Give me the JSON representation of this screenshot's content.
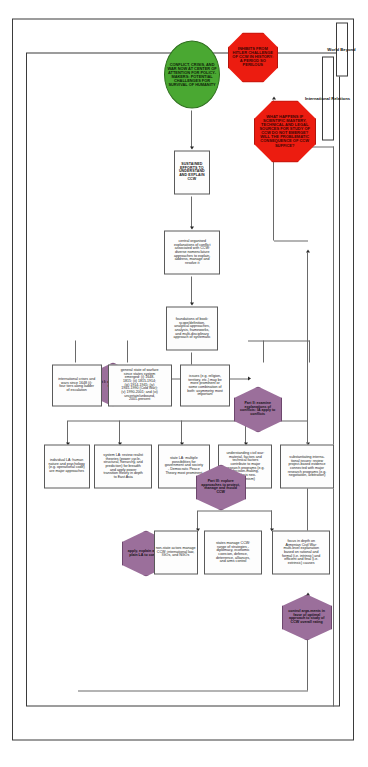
{
  "diagram": {
    "outer_labels": {
      "world_beyond": "World Beyond",
      "international_relations": "International Relations"
    },
    "colors": {
      "octagon_red": "#ec1c10",
      "hexagon_purple": "#9b6f9b",
      "ellipse_green": "#4aa832",
      "box_border": "#5a5a5a",
      "frame": "#3b3b3b"
    },
    "nodes": {
      "start_ellipse": "CONFLICT, CRISIS, AND WAR NOW AT CENTER OF ATTENTION FOR POLICY-MAKERS: POTENTIAL CHALLENGES FOR SURVIVAL OF HUMANITY",
      "sustained_efforts": "SUSTAINED EFFORTS TO UNDERSTAND AND EXPLAIN CCW",
      "central_organised": "central organised explanations of conflict associated with CCW: diverse nomenclature approaches to explain, address, manage and resolve it",
      "foundations_box": "foundations of book: scope/definition, analytical approaches, analysis, frameworks, and multi-disciplinary approach of systematic",
      "part_i": "Part I: address CCW trends",
      "international_crises": "international crises and wars since 1648 (i): four tiers along ladder of escalation",
      "general_state": "general state of warfare since states system emerged: (i) 1648-1815; (ii) 1815-1914; (iii) 1914-1945; (iv) 1945-1990 (Cold War); (v) 1990-2001; and (vi) uncertain/unbound, 2001-present",
      "issues_box": "issues (e.g. religion, territory, etc.) may be more prominent or some combination of both: asymmetry most important",
      "part_ii": "Part II: examine explanations of conflicts: IA apply to conflicts",
      "individual_la": "individual LA: human nature and psychology (e.g. operational code) are major approaches",
      "system_la": "system LA: review realist theories (power cycle, structural, hierarchy, and prediction) for breadth and apply power transition theory in depth to East Asia",
      "state_la": "state LA: multiple possibilities for government and society - Democratic Peace Theory most prominent",
      "understanding_box": "understanding civil war: material, factors and technical factors contribute to major research programs (e.g. decision-making, analysis neo-Kantianism)",
      "substantiating_box": "substantiating interna-tional issues: review project-based evidence connected with major research programs (e.g. negotiation, arbitration)",
      "focus_in_depth": "focus in depth on Armenian Civil War: multi-level explanation based on rational and formal (i.e. intrinsic) and efficient and final (i.e. extrinsic) causes",
      "part_iii": "Part III: explore approaches to protect, manage and mould CCW",
      "states_manage": "states manage CCW: range of strategies - diplomacy, economic coercion, defence, deterrence, alliances, and arms control",
      "nonstate_manage": "non-state actors manage CCW: international law, IGOs, and NGOs",
      "apply_explain": "apply, explain and ex-plain LA to conflicts",
      "control_upper": "control arga-ments in favor of optimal approach to study of CCW overall rating",
      "what_happens": "WHAT HAPPENS IF SCIENTIFIC MASTERY, TECHNICAL AND LEGAL SOURCES FOR STUDY OF CCW DO NOT EMERGE? WILL THE PROBLEMATIC CONSEQUENCE OF CCW SUFFICE?",
      "inhibits": "INHIBITS FROM HITLER CHALLENGE OF CCW IN HISTORY: A PERIOD SO PERILOUS"
    },
    "shape_types": {
      "start_ellipse": "ellipse",
      "part_i": "hexagon",
      "part_ii": "hexagon",
      "part_iii": "hexagon",
      "apply_explain": "hexagon",
      "control_upper": "hexagon",
      "what_happens": "octagon",
      "inhibits": "octagon"
    }
  }
}
